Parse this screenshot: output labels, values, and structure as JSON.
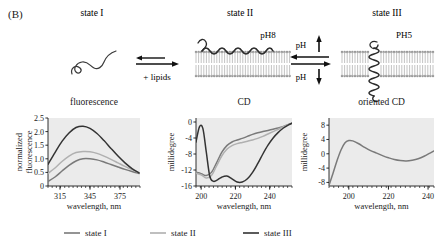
{
  "figure": {
    "panel_letter": "(B)",
    "states": [
      {
        "title": "state I",
        "icon": "random-coil-peptide"
      },
      {
        "title": "state II",
        "icon": "peptide-on-bilayer-surface",
        "ph_label": "pH8"
      },
      {
        "title": "state III",
        "icon": "transmembrane-helix-in-bilayer",
        "ph_label": "PH5"
      }
    ],
    "arrows": {
      "lipids_label": "+ lipids",
      "ph_up_label": "pH",
      "ph_down_label": "pH"
    }
  },
  "legend": {
    "position": "bottom-center",
    "items": [
      {
        "label": "state I",
        "color": "#7a7a7a"
      },
      {
        "label": "state II",
        "color": "#b0b0b0"
      },
      {
        "label": "state III",
        "color": "#333333"
      }
    ]
  },
  "chart_data": [
    {
      "type": "line",
      "title": "fluorescence",
      "xlabel": "wavelength, nm",
      "ylabel": "normalized fluorescence",
      "xlim": [
        303,
        395
      ],
      "ylim": [
        0,
        2.5
      ],
      "xticks": [
        315,
        345,
        375
      ],
      "yticks": [
        0,
        0.5,
        1.0,
        1.5,
        2.0,
        2.5
      ],
      "ytick_labels": [
        "0",
        "0.5",
        "1.0",
        "1.5",
        "2.0",
        "2.5"
      ],
      "grid": false,
      "legend": "shared-bottom",
      "series": [
        {
          "name": "state I",
          "color": "#7a7a7a",
          "x": [
            303,
            310,
            317,
            324,
            331,
            338,
            345,
            352,
            359,
            366,
            373,
            380,
            387,
            394
          ],
          "y": [
            0.17,
            0.33,
            0.55,
            0.76,
            0.92,
            1.0,
            1.0,
            0.96,
            0.88,
            0.79,
            0.7,
            0.61,
            0.53,
            0.46
          ]
        },
        {
          "name": "state II",
          "color": "#b0b0b0",
          "x": [
            303,
            310,
            317,
            324,
            331,
            338,
            345,
            352,
            359,
            366,
            373,
            380,
            387,
            394
          ],
          "y": [
            0.46,
            0.66,
            0.9,
            1.1,
            1.23,
            1.27,
            1.26,
            1.2,
            1.1,
            0.98,
            0.85,
            0.72,
            0.6,
            0.49
          ]
        },
        {
          "name": "state III",
          "color": "#333333",
          "x": [
            303,
            310,
            317,
            324,
            331,
            338,
            345,
            352,
            359,
            366,
            373,
            380,
            387,
            394
          ],
          "y": [
            0.8,
            1.23,
            1.64,
            1.95,
            2.15,
            2.2,
            2.12,
            1.93,
            1.67,
            1.38,
            1.1,
            0.85,
            0.64,
            0.48
          ]
        }
      ]
    },
    {
      "type": "line",
      "title": "CD",
      "xlabel": "wavelength, nm",
      "ylabel": "millidegree",
      "xlim": [
        197,
        253
      ],
      "ylim": [
        -16,
        1
      ],
      "xticks": [
        200,
        220,
        240
      ],
      "yticks": [
        0,
        -4,
        -8,
        -12,
        -16
      ],
      "ytick_labels": [
        "0",
        "-4",
        "-8",
        "-12",
        "-16"
      ],
      "grid": false,
      "legend": "shared-bottom",
      "series": [
        {
          "name": "state I",
          "color": "#7a7a7a",
          "x": [
            197,
            200,
            203,
            206,
            209,
            212,
            215,
            218,
            221,
            224,
            227,
            230,
            233,
            236,
            239,
            242,
            245,
            248,
            251,
            253
          ],
          "y": [
            -12.6,
            -12.9,
            -13.4,
            -12.6,
            -10.2,
            -7.6,
            -5.9,
            -5.0,
            -4.5,
            -4.1,
            -3.6,
            -3.1,
            -2.7,
            -2.4,
            -2.1,
            -1.8,
            -1.5,
            -1.1,
            -0.6,
            -0.3
          ]
        },
        {
          "name": "state II",
          "color": "#b0b0b0",
          "x": [
            197,
            200,
            203,
            206,
            209,
            212,
            215,
            218,
            221,
            224,
            227,
            230,
            233,
            236,
            239,
            242,
            245,
            248,
            251,
            253
          ],
          "y": [
            -12.8,
            -13.2,
            -14.0,
            -13.4,
            -11.0,
            -8.5,
            -6.8,
            -5.9,
            -5.4,
            -5.1,
            -4.8,
            -4.5,
            -4.1,
            -3.6,
            -3.0,
            -2.4,
            -1.8,
            -1.2,
            -0.6,
            -0.3
          ]
        },
        {
          "name": "state III",
          "color": "#333333",
          "x": [
            197,
            199,
            201,
            203,
            205,
            207,
            209,
            212,
            215,
            218,
            221,
            224,
            227,
            230,
            233,
            236,
            239,
            242,
            245,
            248,
            251,
            253
          ],
          "y": [
            -5.0,
            -1.2,
            -1.6,
            -7.5,
            -13.5,
            -14.8,
            -14.6,
            -13.8,
            -13.5,
            -14.2,
            -15.0,
            -15.0,
            -14.2,
            -12.6,
            -10.4,
            -8.0,
            -5.8,
            -4.0,
            -2.6,
            -1.5,
            -0.7,
            -0.3
          ]
        }
      ]
    },
    {
      "type": "line",
      "title": "oriented CD",
      "xlabel": "wavelength, nm",
      "ylabel": "millidegree",
      "xlim": [
        190,
        243
      ],
      "ylim": [
        -9,
        10
      ],
      "xticks": [
        200,
        220,
        240
      ],
      "yticks": [
        8,
        4,
        0,
        -4,
        -8
      ],
      "ytick_labels": [
        "8",
        "4",
        "0",
        "-4",
        "-8"
      ],
      "grid": false,
      "legend": "none",
      "series": [
        {
          "name": "oriented CD trace",
          "color": "#7a7a7a",
          "x": [
            190,
            192,
            194,
            196,
            198,
            200,
            202,
            205,
            208,
            211,
            214,
            217,
            220,
            223,
            226,
            229,
            232,
            235,
            238,
            241,
            243
          ],
          "y": [
            -8.8,
            -5.5,
            -2.0,
            1.0,
            3.0,
            3.7,
            3.6,
            2.8,
            1.8,
            0.9,
            0.2,
            -0.5,
            -1.1,
            -1.6,
            -1.9,
            -2.0,
            -1.8,
            -1.4,
            -0.7,
            0.2,
            0.8
          ]
        }
      ]
    }
  ]
}
